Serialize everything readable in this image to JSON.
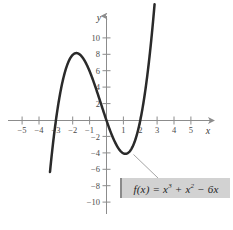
{
  "figure": {
    "background_color": "#ffffff",
    "curve_color": "#2a2a2a",
    "axis_color": "#8c8c8c",
    "label_box_color": "#d2d2d2",
    "label_box_border_color": "#8a8a8a",
    "leader_line_color": "#9a9a9a"
  },
  "axes": {
    "x_axis_name": "x",
    "y_axis_name": "y",
    "x_ticks": [
      {
        "value": -5,
        "label": "−5"
      },
      {
        "value": -4,
        "label": "−4"
      },
      {
        "value": -3,
        "label": "−3"
      },
      {
        "value": -2,
        "label": "−2"
      },
      {
        "value": -1,
        "label": "−1"
      },
      {
        "value": 1,
        "label": "1"
      },
      {
        "value": 2,
        "label": "2"
      },
      {
        "value": 3,
        "label": "3"
      },
      {
        "value": 4,
        "label": "4"
      },
      {
        "value": 5,
        "label": "5"
      }
    ],
    "y_ticks": [
      {
        "value": 10,
        "label": "10"
      },
      {
        "value": 8,
        "label": "8"
      },
      {
        "value": 6,
        "label": "6"
      },
      {
        "value": 4,
        "label": "4"
      },
      {
        "value": 2,
        "label": "2"
      },
      {
        "value": -2,
        "label": "−2"
      },
      {
        "value": -4,
        "label": "−4"
      },
      {
        "value": -6,
        "label": "−6"
      },
      {
        "value": -8,
        "label": "−8"
      },
      {
        "value": -10,
        "label": "−10"
      }
    ]
  },
  "annotation": {
    "equation_plain": "f(x) = x³ + x² − 6x",
    "equation_prefix": "f(x) = x",
    "equation_exp1": "3",
    "equation_mid": " + x",
    "equation_exp2": "2",
    "equation_suffix": " − 6x"
  },
  "chart_data": {
    "type": "line",
    "title": "",
    "xlabel": "x",
    "ylabel": "y",
    "xlim": [
      -6.0,
      6.2
    ],
    "ylim": [
      -12.0,
      12.0
    ],
    "grid": false,
    "legend": "none",
    "function": "f(x) = x^3 + x^2 - 6x",
    "coefficients": {
      "x3": 1,
      "x2": 1,
      "x1": -6,
      "x0": 0
    },
    "roots": [
      -3,
      0,
      2
    ],
    "local_maximum": {
      "x": -1.7863,
      "y": 8.2088
    },
    "local_minimum": {
      "x": 1.1196,
      "y": -4.0606
    },
    "domain_drawn": [
      -3.35,
      2.85
    ],
    "series": [
      {
        "name": "f(x) = x³ + x² − 6x",
        "x": [
          -3.35,
          -3.2,
          -3.0,
          -2.8,
          -2.6,
          -2.4,
          -2.2,
          -2.0,
          -1.8,
          -1.6,
          -1.4,
          -1.2,
          -1.0,
          -0.8,
          -0.6,
          -0.4,
          -0.2,
          0.0,
          0.2,
          0.4,
          0.6,
          0.8,
          1.0,
          1.2,
          1.4,
          1.6,
          1.8,
          2.0,
          2.2,
          2.4,
          2.6,
          2.85
        ],
        "y": [
          -6.26,
          -3.33,
          0.0,
          2.69,
          4.78,
          6.34,
          7.39,
          8.0,
          8.21,
          8.06,
          7.62,
          6.91,
          6.0,
          4.93,
          3.74,
          2.5,
          1.23,
          0.0,
          -1.15,
          -2.18,
          -3.02,
          -3.65,
          -4.0,
          -4.03,
          -3.7,
          -2.94,
          -1.73,
          0.0,
          2.69,
          5.98,
          9.94,
          15.48
        ]
      }
    ]
  }
}
